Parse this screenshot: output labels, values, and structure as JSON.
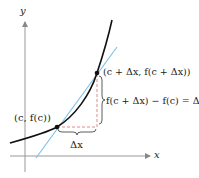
{
  "axes": {
    "x_label": "x",
    "y_label": "y"
  },
  "labels": {
    "point1": "(c, f(c))",
    "point2": "(c + Δx, f(c + Δx))",
    "dy": "f(c + Δx) − f(c) = Δy",
    "dx": "Δx"
  },
  "colors": {
    "curve": "#111111",
    "tangent": "#7fc4e8",
    "dashed": "#e08a8a",
    "axis": "#888888"
  }
}
